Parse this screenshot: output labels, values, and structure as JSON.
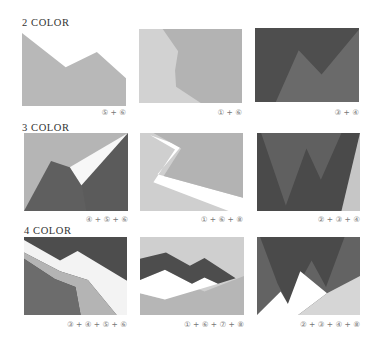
{
  "colors": {
    "1": "#d0d0d0",
    "2": "#4d4d4d",
    "3": "#595959",
    "4": "#6e6e6e",
    "5": "#737373",
    "6": "#b4b4b4",
    "7": "#ffffff",
    "8": "#dcdcdc",
    "white": "#ffffff"
  },
  "sections": [
    {
      "title": "2 COLOR",
      "panels": [
        {
          "label": "⑤ + ⑥",
          "palette": [
            "5",
            "6"
          ]
        },
        {
          "label": "① + ⑥",
          "palette": [
            "1",
            "6"
          ]
        },
        {
          "label": "③ + ④",
          "palette": [
            "3",
            "4"
          ]
        }
      ]
    },
    {
      "title": "3 COLOR",
      "panels": [
        {
          "label": "④ + ⑤ + ⑥",
          "palette": [
            "4",
            "5",
            "6"
          ]
        },
        {
          "label": "① + ⑥ + ⑧",
          "palette": [
            "1",
            "6",
            "8"
          ]
        },
        {
          "label": "② + ③ + ④",
          "palette": [
            "2",
            "3",
            "4"
          ]
        }
      ]
    },
    {
      "title": "4 COLOR",
      "panels": [
        {
          "label": "③ + ④ + ⑤ + ⑥",
          "palette": [
            "3",
            "4",
            "5",
            "6"
          ]
        },
        {
          "label": "① + ⑥ + ⑦ + ⑧",
          "palette": [
            "1",
            "6",
            "7",
            "8"
          ]
        },
        {
          "label": "② + ③ + ④ + ⑧",
          "palette": [
            "2",
            "3",
            "4",
            "8"
          ]
        }
      ]
    }
  ]
}
